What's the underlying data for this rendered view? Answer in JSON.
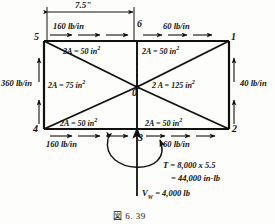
{
  "figure": {
    "caption": "図  6. 39",
    "dimension": {
      "label": "7.5\"",
      "unit": "in"
    },
    "nodes": [
      {
        "id": "5",
        "position": "top-left"
      },
      {
        "id": "6",
        "position": "top-center"
      },
      {
        "id": "1",
        "position": "top-right"
      },
      {
        "id": "0",
        "position": "center"
      },
      {
        "id": "4",
        "position": "bottom-left"
      },
      {
        "id": "3",
        "position": "bottom-center"
      },
      {
        "id": "2",
        "position": "bottom-right"
      }
    ],
    "edge_loads": [
      {
        "name": "top-left-load",
        "value": "160 lb/in",
        "edge": "top-left",
        "direction": "right"
      },
      {
        "name": "top-right-load",
        "value": "60 lb/in",
        "edge": "top-right",
        "direction": "right"
      },
      {
        "name": "left-load",
        "value": "360 lb/in",
        "edge": "left",
        "direction": "up"
      },
      {
        "name": "right-load",
        "value": "40 lb/in",
        "edge": "right",
        "direction": "up"
      },
      {
        "name": "bottom-left-load",
        "value": "160 lb/in",
        "edge": "bottom-left",
        "direction": "right"
      },
      {
        "name": "bottom-right-load",
        "value": "60 lb/in",
        "edge": "bottom-right",
        "direction": "right"
      }
    ],
    "panels": [
      {
        "name": "panel-top-left",
        "area": "2A = 50 in",
        "exp": "2"
      },
      {
        "name": "panel-top-right",
        "area": "2A = 50 in",
        "exp": "2"
      },
      {
        "name": "panel-left",
        "area": "2A = 75 in",
        "exp": "2"
      },
      {
        "name": "panel-right",
        "area": "2 A = 125 in",
        "exp": "2"
      },
      {
        "name": "panel-bottom-left",
        "area": "2A = 50 in",
        "exp": "2"
      },
      {
        "name": "panel-bottom-right",
        "area": "2A = 50 in",
        "exp": "2"
      }
    ],
    "annotations": {
      "torque_line1": "T = 8,000 x 5.5",
      "torque_line2": "= 44,000 in-lb",
      "shear_symbol": "V",
      "shear_subscript": "W",
      "shear_value": "= 4,000 lb"
    },
    "colors": {
      "ink": "#111111",
      "background": "#fdfdfb"
    }
  }
}
